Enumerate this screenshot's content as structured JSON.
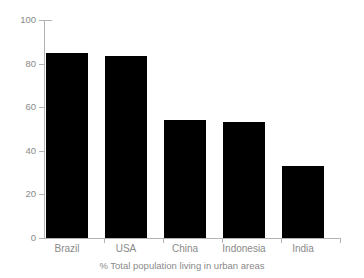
{
  "chart_data": {
    "type": "bar",
    "title": "",
    "subtitle": "",
    "caption": "% Total population living in urban areas",
    "categories": [
      "Brazil",
      "USA",
      "China",
      "Indonesia",
      "India"
    ],
    "values": [
      85,
      83.5,
      54,
      53,
      33
    ],
    "series": [
      {
        "name": "% Total population living in urban areas",
        "values": [
          85,
          83.5,
          54,
          53,
          33
        ]
      }
    ],
    "xlabel": "",
    "ylabel": "",
    "ylim": [
      0,
      100
    ],
    "yticks": [
      "0",
      "20",
      "40",
      "60",
      "80",
      "100"
    ],
    "ytick_values": [
      0,
      20,
      40,
      60,
      80,
      100
    ],
    "grid": false,
    "legend": false,
    "legend_position": "none",
    "bar_color": "#000000",
    "axis_color": "#b3b3b3",
    "text_color": "#8a8a8a",
    "background_color": "#ffffff"
  },
  "figure": {
    "caption": "% Total population living in urban areas"
  }
}
